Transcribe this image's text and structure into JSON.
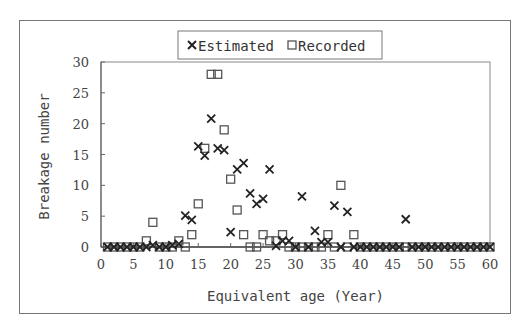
{
  "chart_data": {
    "type": "scatter",
    "title": "",
    "xlabel": "Equivalent age (Year)",
    "ylabel": "Breakage number",
    "xlim": [
      0,
      60
    ],
    "ylim": [
      0,
      30
    ],
    "xticks": [
      0,
      5,
      10,
      15,
      20,
      25,
      30,
      35,
      40,
      45,
      50,
      55,
      60
    ],
    "yticks": [
      0,
      5,
      10,
      15,
      20,
      25,
      30
    ],
    "grid": false,
    "legend_position": "top-center",
    "legend": [
      "Estimated",
      "Recorded"
    ],
    "series": [
      {
        "name": "Estimated",
        "marker": "x",
        "points": [
          [
            1,
            0
          ],
          [
            2,
            0
          ],
          [
            3,
            0
          ],
          [
            4,
            0
          ],
          [
            5,
            0
          ],
          [
            6,
            0
          ],
          [
            7,
            0
          ],
          [
            8,
            0.3
          ],
          [
            9,
            0
          ],
          [
            10,
            0
          ],
          [
            11,
            0.3
          ],
          [
            12,
            0.5
          ],
          [
            13,
            5.1
          ],
          [
            14,
            4.4
          ],
          [
            15,
            16.3
          ],
          [
            16,
            14.8
          ],
          [
            17,
            20.8
          ],
          [
            18,
            16.0
          ],
          [
            19,
            15.7
          ],
          [
            20,
            2.4
          ],
          [
            21,
            12.6
          ],
          [
            22,
            13.6
          ],
          [
            23,
            8.7
          ],
          [
            24,
            7.0
          ],
          [
            25,
            7.8
          ],
          [
            26,
            12.6
          ],
          [
            27,
            0.2
          ],
          [
            28,
            1.0
          ],
          [
            29,
            1.0
          ],
          [
            30,
            0
          ],
          [
            31,
            8.2
          ],
          [
            32,
            0
          ],
          [
            33,
            2.6
          ],
          [
            34,
            0.8
          ],
          [
            35,
            0.8
          ],
          [
            36,
            6.7
          ],
          [
            37,
            0
          ],
          [
            38,
            5.7
          ],
          [
            39,
            0
          ],
          [
            40,
            0
          ],
          [
            41,
            0
          ],
          [
            42,
            0
          ],
          [
            43,
            0
          ],
          [
            44,
            0
          ],
          [
            45,
            0
          ],
          [
            46,
            0
          ],
          [
            47,
            4.5
          ],
          [
            48,
            0
          ],
          [
            49,
            0
          ],
          [
            50,
            0
          ],
          [
            51,
            0
          ],
          [
            52,
            0
          ],
          [
            53,
            0
          ],
          [
            54,
            0
          ],
          [
            55,
            0
          ],
          [
            56,
            0
          ],
          [
            57,
            0
          ],
          [
            58,
            0
          ],
          [
            59,
            0
          ],
          [
            60,
            0
          ]
        ]
      },
      {
        "name": "Recorded",
        "marker": "square",
        "points": [
          [
            1,
            0
          ],
          [
            2,
            0
          ],
          [
            3,
            0
          ],
          [
            4,
            0
          ],
          [
            5,
            0
          ],
          [
            6,
            0
          ],
          [
            7,
            1
          ],
          [
            8,
            4
          ],
          [
            9,
            0
          ],
          [
            10,
            0
          ],
          [
            11,
            0
          ],
          [
            12,
            1
          ],
          [
            13,
            0
          ],
          [
            14,
            2
          ],
          [
            15,
            7
          ],
          [
            16,
            16
          ],
          [
            17,
            28
          ],
          [
            18,
            28
          ],
          [
            19,
            19
          ],
          [
            20,
            11
          ],
          [
            21,
            6
          ],
          [
            22,
            2
          ],
          [
            23,
            0
          ],
          [
            24,
            0
          ],
          [
            25,
            2
          ],
          [
            26,
            1
          ],
          [
            27,
            1
          ],
          [
            28,
            2
          ],
          [
            29,
            0
          ],
          [
            30,
            0
          ],
          [
            31,
            0
          ],
          [
            32,
            0
          ],
          [
            33,
            0
          ],
          [
            34,
            0
          ],
          [
            35,
            2
          ],
          [
            36,
            0
          ],
          [
            37,
            10
          ],
          [
            38,
            0
          ],
          [
            39,
            2
          ],
          [
            40,
            0
          ],
          [
            41,
            0
          ],
          [
            42,
            0
          ],
          [
            43,
            0
          ],
          [
            44,
            0
          ],
          [
            45,
            0
          ],
          [
            46,
            0
          ],
          [
            47,
            0
          ],
          [
            48,
            0
          ],
          [
            49,
            0
          ],
          [
            50,
            0
          ],
          [
            51,
            0
          ],
          [
            52,
            0
          ],
          [
            53,
            0
          ],
          [
            54,
            0
          ],
          [
            55,
            0
          ],
          [
            56,
            0
          ],
          [
            57,
            0
          ],
          [
            58,
            0
          ],
          [
            59,
            0
          ],
          [
            60,
            0
          ]
        ]
      }
    ]
  },
  "legend": {
    "estimated": "Estimated",
    "recorded": "Recorded"
  },
  "axes": {
    "x_title": "Equivalent age (Year)",
    "y_title": "Breakage number"
  }
}
